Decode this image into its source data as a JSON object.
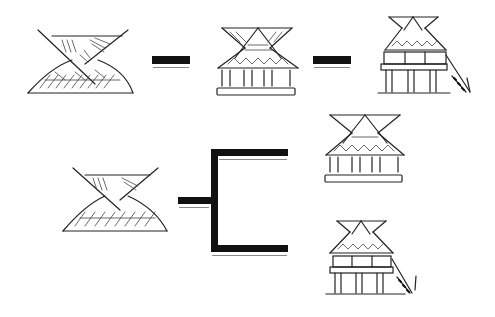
{
  "diagram": {
    "type": "sequential-and-branching-illustration",
    "colors": {
      "ink": "#111111",
      "background": "#ffffff",
      "shadow": "#888888"
    },
    "rows": [
      {
        "name": "linear-sequence",
        "stages": [
          {
            "id": "roof-form",
            "label": ""
          },
          {
            "id": "raised-house-on-platform",
            "label": ""
          },
          {
            "id": "two-storey-house-with-ladder",
            "label": ""
          }
        ],
        "connectors": [
          "dash",
          "dash"
        ]
      },
      {
        "name": "branching-sequence",
        "source": {
          "id": "roof-form",
          "label": ""
        },
        "connector": "branch-bracket",
        "targets": [
          {
            "id": "raised-house-on-platform",
            "label": ""
          },
          {
            "id": "two-storey-house-with-ladder",
            "label": ""
          }
        ]
      }
    ]
  }
}
